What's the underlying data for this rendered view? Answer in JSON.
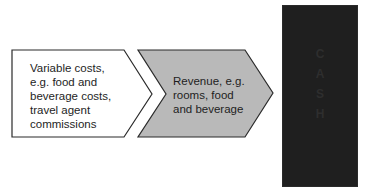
{
  "diagram": {
    "type": "flow",
    "nodes": [
      {
        "id": "variable-costs",
        "shape": "pentagon-arrow",
        "fill": "#ffffff",
        "text": "Variable costs,\ne.g. food and\nbeverage costs,\ntravel agent\ncommissions"
      },
      {
        "id": "revenue",
        "shape": "chevron",
        "fill": "#b9b9b9",
        "text": "Revenue, e.g.\nrooms, food\nand beverage"
      },
      {
        "id": "cash",
        "shape": "rectangle",
        "fill": "#1f1f1f",
        "letters": [
          "C",
          "A",
          "S",
          "H"
        ]
      }
    ],
    "edges": [
      {
        "from": "variable-costs",
        "to": "revenue"
      },
      {
        "from": "revenue",
        "to": "cash"
      }
    ],
    "colors": {
      "stroke": "#2a2a2a",
      "revenue_fill": "#b9b9b9",
      "cash_fill": "#1f1f1f"
    }
  }
}
